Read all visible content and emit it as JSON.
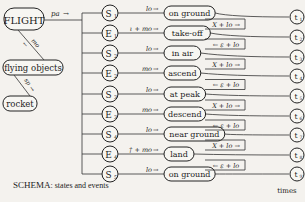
{
  "hierarchy": {
    "root": "FLIGHT",
    "child": "flying objects",
    "leaf": "rocket",
    "rel_root_child": "mo",
    "rel_child_leaf": "sp",
    "rel_root_bus": "pa"
  },
  "rows": [
    {
      "node": "S",
      "sub": "1",
      "event": "lo",
      "state": "on ground"
    },
    {
      "node": "E",
      "sub": "1",
      "event": "ι + mo",
      "state": "take-off"
    },
    {
      "node": "S",
      "sub": "2",
      "event": "lo",
      "state": "in air"
    },
    {
      "node": "E",
      "sub": "2",
      "event": "mo",
      "state": "ascend"
    },
    {
      "node": "S",
      "sub": "3",
      "event": "lo",
      "state": "at peak"
    },
    {
      "node": "E",
      "sub": "3",
      "event": "mo",
      "state": "descend"
    },
    {
      "node": "S",
      "sub": "4",
      "event": "lo",
      "state": "near ground"
    },
    {
      "node": "E",
      "sub": "4",
      "event": "† + mo",
      "state": "land"
    },
    {
      "node": "S",
      "sub": "5",
      "event": "lo",
      "state": "on ground"
    }
  ],
  "transitions": [
    "Χ + lo →",
    "← ε + lo",
    "Χ + lo →",
    "← ε + lo",
    "Χ + lo →",
    "← ε + lo",
    "Χ + lo →",
    "← ε + lo"
  ],
  "times": [
    {
      "label": "t",
      "sub": "1"
    },
    {
      "label": "t",
      "sub": "2"
    },
    {
      "label": "t",
      "sub": "3"
    },
    {
      "label": "t",
      "sub": "4"
    },
    {
      "label": "t",
      "sub": "5"
    },
    {
      "label": "t",
      "sub": "6"
    },
    {
      "label": "t",
      "sub": "7"
    },
    {
      "label": "t",
      "sub": "8"
    },
    {
      "label": "t",
      "sub": "9"
    }
  ],
  "times_label": "times",
  "caption": {
    "title": "SCHEMA",
    "rest": ": states and events"
  }
}
